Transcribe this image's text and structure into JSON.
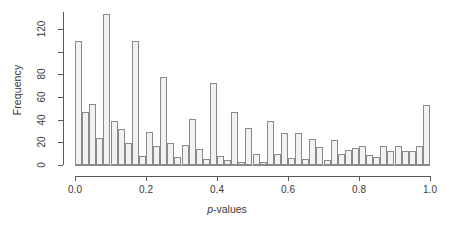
{
  "chart_data": {
    "type": "bar",
    "title": "",
    "subtitle": "",
    "xlabel": "p-values",
    "xlabel_italic_prefix": "p",
    "xlabel_rest": "-values",
    "ylabel": "Frequency",
    "xlim": [
      0.0,
      1.0
    ],
    "ylim": [
      0,
      135
    ],
    "grid": false,
    "legend": null,
    "bin_width": 0.02,
    "x_tick_values": [
      0.0,
      0.2,
      0.4,
      0.6,
      0.8,
      1.0
    ],
    "x_tick_labels": [
      "0.0",
      "0.2",
      "0.4",
      "0.6",
      "0.8",
      "1.0"
    ],
    "y_tick_values": [
      0,
      20,
      40,
      60,
      80,
      100,
      120
    ],
    "y_tick_labels": [
      "0",
      "20",
      "40",
      "60",
      "80",
      "",
      "120"
    ],
    "bin_starts": [
      0.0,
      0.02,
      0.04,
      0.06,
      0.08,
      0.1,
      0.12,
      0.14,
      0.16,
      0.18,
      0.2,
      0.22,
      0.24,
      0.26,
      0.28,
      0.3,
      0.32,
      0.34,
      0.36,
      0.38,
      0.4,
      0.42,
      0.44,
      0.46,
      0.48,
      0.5,
      0.52,
      0.54,
      0.56,
      0.58,
      0.6,
      0.62,
      0.64,
      0.66,
      0.68,
      0.7,
      0.72,
      0.74,
      0.76,
      0.78,
      0.8,
      0.82,
      0.84,
      0.86,
      0.88,
      0.9,
      0.92,
      0.94,
      0.96,
      0.98
    ],
    "categories": [
      "0.00",
      "0.02",
      "0.04",
      "0.06",
      "0.08",
      "0.10",
      "0.12",
      "0.14",
      "0.16",
      "0.18",
      "0.20",
      "0.22",
      "0.24",
      "0.26",
      "0.28",
      "0.30",
      "0.32",
      "0.34",
      "0.36",
      "0.38",
      "0.40",
      "0.42",
      "0.44",
      "0.46",
      "0.48",
      "0.50",
      "0.52",
      "0.54",
      "0.56",
      "0.58",
      "0.60",
      "0.62",
      "0.64",
      "0.66",
      "0.68",
      "0.70",
      "0.72",
      "0.74",
      "0.76",
      "0.78",
      "0.80",
      "0.82",
      "0.84",
      "0.86",
      "0.88",
      "0.90",
      "0.92",
      "0.94",
      "0.96",
      "0.98"
    ],
    "values": [
      109,
      47,
      54,
      24,
      133,
      39,
      32,
      19,
      109,
      8,
      29,
      17,
      78,
      19,
      7,
      18,
      41,
      14,
      5,
      72,
      8,
      4,
      47,
      3,
      33,
      10,
      3,
      39,
      10,
      28,
      6,
      28,
      5,
      23,
      16,
      4,
      22,
      10,
      13,
      15,
      17,
      9,
      7,
      17,
      12,
      17,
      12,
      12,
      17,
      53
    ],
    "bar_fill": "#f2f2f2",
    "bar_edge": "#8a8a8a",
    "axis_color": "#5a5a5a",
    "text_color": "#3a3a3a",
    "background": "#ffffff"
  }
}
